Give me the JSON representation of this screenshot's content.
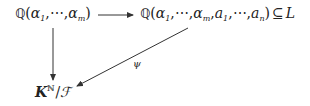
{
  "diagram": {
    "type": "commutative-diagram",
    "nodes": {
      "top_left": {
        "field_symbol": "ℚ",
        "open": "(",
        "gen1": "α",
        "gen1_sub": "1",
        "sep1": ",⋯,",
        "gen2": "α",
        "gen2_sub": "m",
        "close": ")"
      },
      "top_right": {
        "field_symbol": "ℚ",
        "open": "(",
        "gen1": "α",
        "gen1_sub": "1",
        "sep1": ",⋯,",
        "gen2": "α",
        "gen2_sub": "m",
        "sep2": ",",
        "gen3": "a",
        "gen3_sub": "1",
        "sep3": ",⋯,",
        "gen4": "a",
        "gen4_sub": "n",
        "close": ")",
        "relation": "⊆",
        "target": "L"
      },
      "bottom_left": {
        "base": "K",
        "superscript": "ℕ",
        "slash": "/",
        "quotient": "ℱ"
      }
    },
    "edges": [
      {
        "from": "top_left",
        "to": "top_right",
        "label": ""
      },
      {
        "from": "top_left",
        "to": "bottom_left",
        "label": ""
      },
      {
        "from": "top_right",
        "to": "bottom_left",
        "label": "ψ"
      }
    ],
    "colors": {
      "stroke": "#333333",
      "text": "#222222",
      "background": "#ffffff"
    }
  }
}
